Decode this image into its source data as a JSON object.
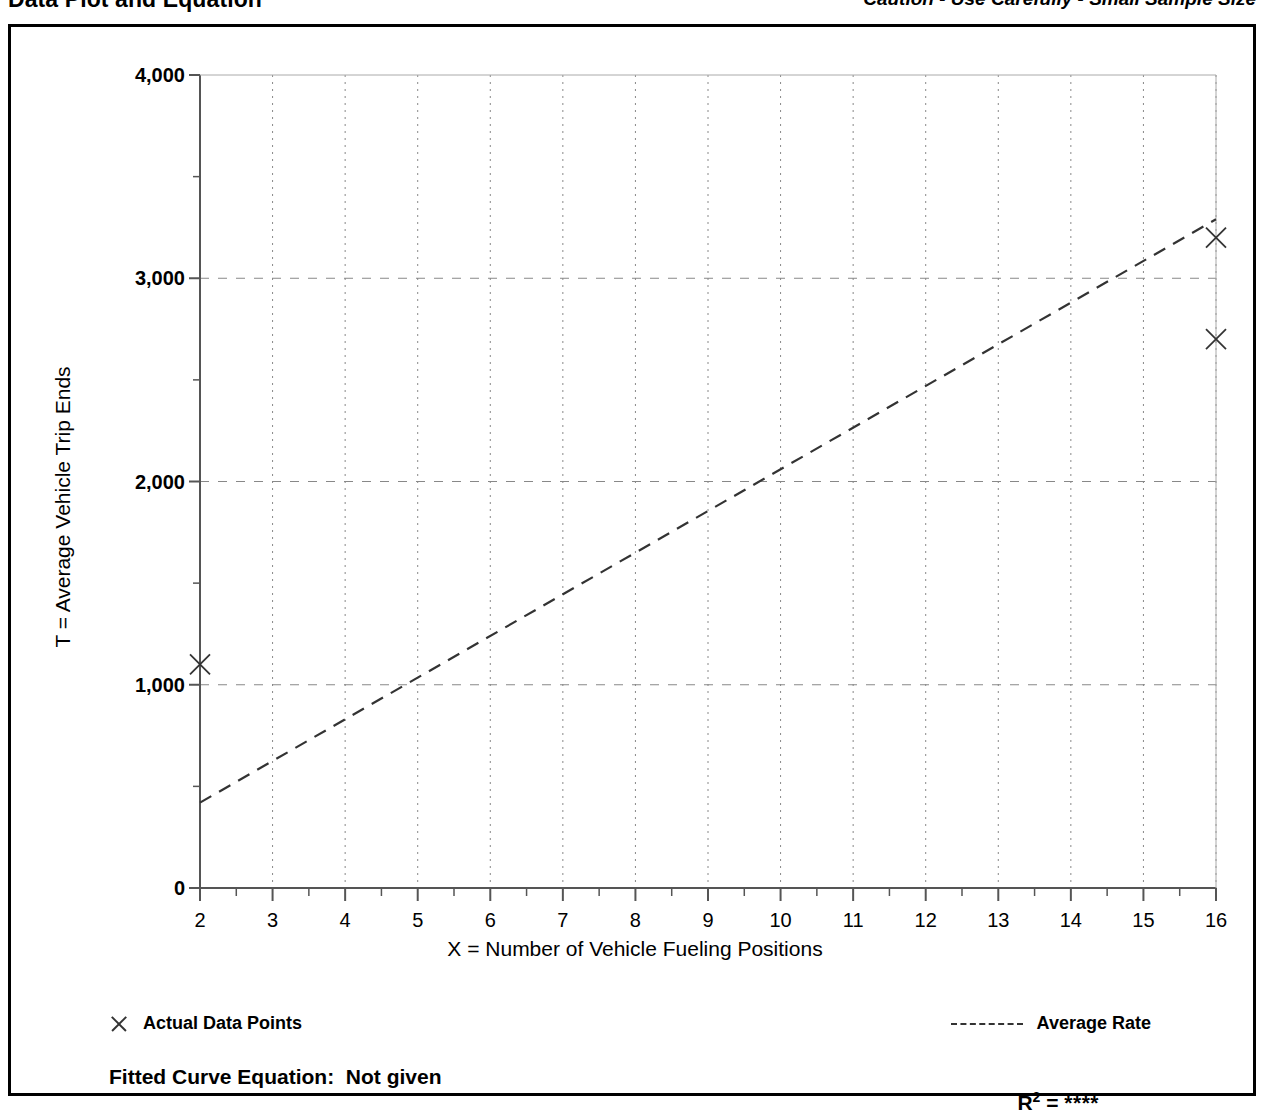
{
  "header": {
    "title": "Data Plot and Equation",
    "caution": "Caution - Use Carefully - Small Sample Size"
  },
  "legend": {
    "points_label": "Actual Data Points",
    "line_label": "Average Rate",
    "point_glyph": "x-mark-icon",
    "line_glyph": "dashed-line-icon"
  },
  "equation": {
    "label": "Fitted Curve Equation:  Not given",
    "r2_prefix": "R",
    "r2_exponent": "2",
    "r2_equals": " = ",
    "r2_value": "****"
  },
  "colors": {
    "ink": "#000000",
    "axis": "#555555",
    "grid": "#888888",
    "marker": "#333333",
    "background": "#ffffff"
  },
  "chart_data": {
    "type": "scatter",
    "title": "Data Plot and Equation",
    "xlabel": "X = Number of Vehicle Fueling Positions",
    "ylabel": "T = Average Vehicle Trip Ends",
    "xlim": [
      2,
      16
    ],
    "ylim": [
      0,
      4000
    ],
    "xticks": [
      2,
      3,
      4,
      5,
      6,
      7,
      8,
      9,
      10,
      11,
      12,
      13,
      14,
      15,
      16
    ],
    "xtick_labels": [
      "2",
      "3",
      "4",
      "5",
      "6",
      "7",
      "8",
      "9",
      "10",
      "11",
      "12",
      "13",
      "14",
      "15",
      "16"
    ],
    "yticks": [
      0,
      1000,
      2000,
      3000,
      4000
    ],
    "ytick_labels": [
      "0",
      "1,000",
      "2,000",
      "3,000",
      "4,000"
    ],
    "y_minor_ticks": [
      500,
      1500,
      2500,
      3500
    ],
    "grid": true,
    "grid_style": "dashed",
    "legend_position": "below-axes",
    "series": [
      {
        "name": "Actual Data Points",
        "type": "scatter",
        "marker": "x",
        "points": [
          {
            "x": 2,
            "y": 1100
          },
          {
            "x": 16,
            "y": 3200
          },
          {
            "x": 16,
            "y": 2700
          }
        ]
      },
      {
        "name": "Average Rate",
        "type": "line",
        "style": "dashed",
        "points": [
          {
            "x": 2,
            "y": 420
          },
          {
            "x": 16,
            "y": 3290
          }
        ],
        "slope": 205,
        "intercept": 10
      }
    ],
    "annotations": [
      "Caution - Use Carefully - Small Sample Size"
    ]
  }
}
